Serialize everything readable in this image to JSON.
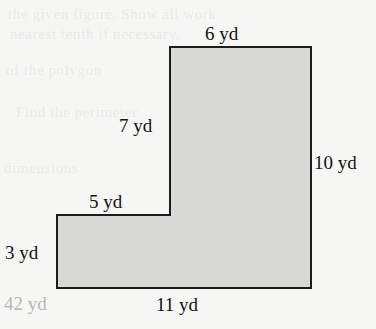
{
  "figure": {
    "unit": "yd",
    "shape_type": "L-shape polygon",
    "fill_color": "#d8d8d6",
    "stroke_color": "#1c1c1c",
    "background_color": "#f6f6f5",
    "answer_color": "#b6b6b4"
  },
  "labels": {
    "top": "6 yd",
    "inner_vertical": "7 yd",
    "right": "10 yd",
    "notch_horizontal": "5 yd",
    "left_vertical": "3 yd",
    "bottom": "11 yd"
  },
  "answer": {
    "perimeter": "42 yd"
  },
  "ghost_text": {
    "line1": "the given figure. Show all work",
    "line2": "nearest tenth if necessary.",
    "line3": "of the polygon",
    "line4": "Find the perimeter",
    "line5": "dimensions"
  },
  "chart_data": {
    "type": "diagram",
    "unit": "yd",
    "vertices": [
      {
        "x": 170,
        "y": 47
      },
      {
        "x": 311,
        "y": 47
      },
      {
        "x": 311,
        "y": 288
      },
      {
        "x": 57,
        "y": 288
      },
      {
        "x": 57,
        "y": 215
      },
      {
        "x": 170,
        "y": 215
      }
    ],
    "edges": [
      {
        "name": "top",
        "label": "6 yd",
        "value": 6,
        "orientation": "horizontal"
      },
      {
        "name": "right",
        "label": "10 yd",
        "value": 10,
        "orientation": "vertical"
      },
      {
        "name": "bottom",
        "label": "11 yd",
        "value": 11,
        "orientation": "horizontal"
      },
      {
        "name": "left-vertical",
        "label": "3 yd",
        "value": 3,
        "orientation": "vertical"
      },
      {
        "name": "notch-horizontal",
        "label": "5 yd",
        "value": 5,
        "orientation": "horizontal"
      },
      {
        "name": "inner-vertical",
        "label": "7 yd",
        "value": 7,
        "orientation": "vertical"
      }
    ],
    "perimeter": 42,
    "perimeter_label": "42 yd"
  }
}
